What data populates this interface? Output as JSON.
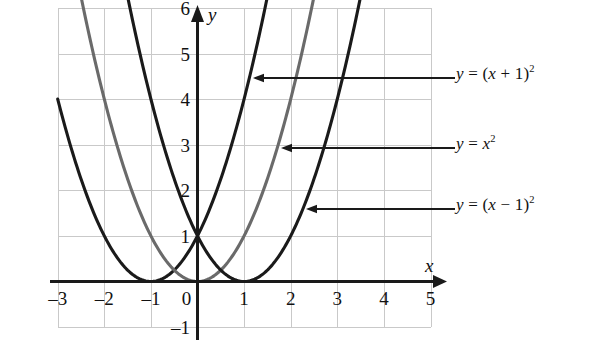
{
  "chart_data": {
    "type": "line",
    "title": "",
    "xlabel": "x",
    "ylabel": "y",
    "xlim": [
      -3,
      5
    ],
    "ylim": [
      -1,
      6
    ],
    "grid": true,
    "grid_spacing": 1,
    "x_ticks": [
      -3,
      -2,
      -1,
      0,
      1,
      2,
      3,
      4,
      5
    ],
    "x_tick_labels": [
      "–3",
      "–2",
      "–1",
      "0",
      "1",
      "2",
      "3",
      "4",
      "5"
    ],
    "y_ticks": [
      -1,
      1,
      2,
      3,
      4,
      5,
      6
    ],
    "y_tick_labels": [
      "–1",
      "1",
      "2",
      "3",
      "4",
      "5",
      "6"
    ],
    "legend_position": "right-annotations",
    "series": [
      {
        "name": "y = (x + 1)²",
        "formula": "(x+1)^2",
        "vertex": [
          -1,
          0
        ],
        "color": "#1a1a1a",
        "x": [
          -3.45,
          -3.0,
          -2.5,
          -2.0,
          -1.5,
          -1.0,
          -0.5,
          0.0,
          0.5,
          1.0,
          1.45
        ],
        "y": [
          6.0,
          4.0,
          2.25,
          1.0,
          0.25,
          0.0,
          0.25,
          1.0,
          2.25,
          4.0,
          6.0
        ]
      },
      {
        "name": "y = x²",
        "formula": "x^2",
        "vertex": [
          0,
          0
        ],
        "color": "#6a6a6a",
        "x": [
          -2.45,
          -2.0,
          -1.5,
          -1.0,
          -0.5,
          0.0,
          0.5,
          1.0,
          1.5,
          2.0,
          2.45
        ],
        "y": [
          6.0,
          4.0,
          2.25,
          1.0,
          0.25,
          0.0,
          0.25,
          1.0,
          2.25,
          4.0,
          6.0
        ]
      },
      {
        "name": "y = (x – 1)²",
        "formula": "(x-1)^2",
        "vertex": [
          1,
          0
        ],
        "color": "#1a1a1a",
        "x": [
          -1.45,
          -1.0,
          -0.5,
          0.0,
          0.5,
          1.0,
          1.5,
          2.0,
          2.5,
          3.0,
          3.45
        ],
        "y": [
          6.0,
          4.0,
          2.25,
          1.0,
          0.25,
          0.0,
          0.25,
          1.0,
          2.25,
          4.0,
          6.0
        ]
      }
    ],
    "annotations": [
      {
        "text": "y = (x + 1)²",
        "lhs": "y",
        "rhs_pre": "(",
        "rhs_var": "x",
        "rhs_op": "+",
        "rhs_num": "1",
        "rhs_post": ")",
        "exponent": "2",
        "target_series": "y = (x + 1)²",
        "arrow_from_x": 455,
        "arrow_to_x": 253,
        "arrow_y": 78
      },
      {
        "text": "y = x²",
        "lhs": "y",
        "rhs_var": "x",
        "exponent": "2",
        "target_series": "y = x²",
        "arrow_from_x": 455,
        "arrow_to_x": 281,
        "arrow_y": 148
      },
      {
        "text": "y = (x – 1)²",
        "lhs": "y",
        "rhs_pre": "(",
        "rhs_var": "x",
        "rhs_op": "–",
        "rhs_num": "1",
        "rhs_post": ")",
        "exponent": "2",
        "target_series": "y = (x – 1)²",
        "arrow_from_x": 455,
        "arrow_to_x": 306,
        "arrow_y": 209
      }
    ],
    "colors": {
      "axis": "#1a1a1a",
      "grid": "#c9c9c9",
      "curve_dark": "#1a1a1a",
      "curve_gray": "#6a6a6a",
      "text": "#111111",
      "background": "#ffffff"
    },
    "axis_labels": {
      "x": "x",
      "y": "y"
    }
  }
}
